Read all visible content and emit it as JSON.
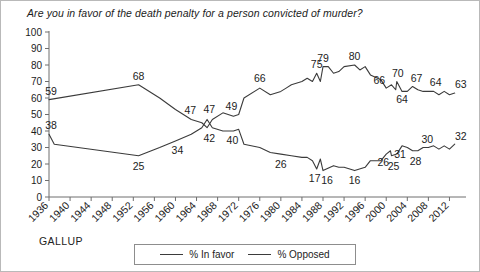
{
  "chart_data": {
    "type": "line",
    "title": "Are you in favor of the death penalty for a person convicted of murder?",
    "source": "GALLUP",
    "xlabel": "",
    "ylabel": "",
    "ylim": [
      0,
      100
    ],
    "ytick_step": 10,
    "grid": false,
    "legend_position": "bottom",
    "yticks": [
      "100",
      "90",
      "80",
      "70",
      "60",
      "50",
      "40",
      "30",
      "20",
      "10",
      "0"
    ],
    "categories": [
      "1936",
      "1940",
      "1944",
      "1948",
      "1952",
      "1956",
      "1960",
      "1964",
      "1968",
      "1972",
      "1976",
      "1980",
      "1984",
      "1988",
      "1992",
      "1996",
      "2000",
      "2004",
      "2008",
      "2012"
    ],
    "xlim": [
      1936,
      2014
    ],
    "series": [
      {
        "name": "% In favor",
        "points": [
          {
            "x": 1936,
            "y": 59,
            "label": "59"
          },
          {
            "x": 1953,
            "y": 68,
            "label": "68"
          },
          {
            "x": 1957,
            "y": 60
          },
          {
            "x": 1960,
            "y": 53
          },
          {
            "x": 1963,
            "y": 47,
            "label": "47"
          },
          {
            "x": 1965,
            "y": 45
          },
          {
            "x": 1966,
            "y": 42
          },
          {
            "x": 1967,
            "y": 47,
            "label": "47"
          },
          {
            "x": 1969,
            "y": 51
          },
          {
            "x": 1971,
            "y": 49,
            "label": "49"
          },
          {
            "x": 1972,
            "y": 50
          },
          {
            "x": 1973,
            "y": 60
          },
          {
            "x": 1976,
            "y": 66,
            "label": "66"
          },
          {
            "x": 1978,
            "y": 62
          },
          {
            "x": 1980,
            "y": 64
          },
          {
            "x": 1981,
            "y": 66
          },
          {
            "x": 1982,
            "y": 68
          },
          {
            "x": 1984,
            "y": 70
          },
          {
            "x": 1985,
            "y": 72
          },
          {
            "x": 1986,
            "y": 70
          },
          {
            "x": 1986.8,
            "y": 75,
            "label": "75"
          },
          {
            "x": 1987.5,
            "y": 70
          },
          {
            "x": 1988,
            "y": 79,
            "label": "79"
          },
          {
            "x": 1989,
            "y": 79
          },
          {
            "x": 1990,
            "y": 75
          },
          {
            "x": 1991,
            "y": 76
          },
          {
            "x": 1992,
            "y": 79
          },
          {
            "x": 1994,
            "y": 80,
            "label": "80"
          },
          {
            "x": 1995,
            "y": 77
          },
          {
            "x": 1996,
            "y": 79
          },
          {
            "x": 1997,
            "y": 74
          },
          {
            "x": 1999,
            "y": 71
          },
          {
            "x": 2000,
            "y": 66,
            "label": "66"
          },
          {
            "x": 2001,
            "y": 68
          },
          {
            "x": 2001.8,
            "y": 65
          },
          {
            "x": 2002,
            "y": 70,
            "label": "70"
          },
          {
            "x": 2003,
            "y": 64,
            "label": "64"
          },
          {
            "x": 2004,
            "y": 64
          },
          {
            "x": 2005,
            "y": 67,
            "label": "67"
          },
          {
            "x": 2006,
            "y": 65
          },
          {
            "x": 2007,
            "y": 64
          },
          {
            "x": 2008,
            "y": 64
          },
          {
            "x": 2009,
            "y": 64,
            "label": "64"
          },
          {
            "x": 2010,
            "y": 62
          },
          {
            "x": 2011,
            "y": 64
          },
          {
            "x": 2012,
            "y": 62
          },
          {
            "x": 2013,
            "y": 63,
            "label": "63"
          }
        ]
      },
      {
        "name": "% Opposed",
        "points": [
          {
            "x": 1936,
            "y": 38,
            "label": "38"
          },
          {
            "x": 1937,
            "y": 32
          },
          {
            "x": 1953,
            "y": 25,
            "label": "25"
          },
          {
            "x": 1957,
            "y": 30
          },
          {
            "x": 1960,
            "y": 34,
            "label": "34"
          },
          {
            "x": 1963,
            "y": 38
          },
          {
            "x": 1965,
            "y": 42
          },
          {
            "x": 1966,
            "y": 47
          },
          {
            "x": 1967,
            "y": 42,
            "label": "42"
          },
          {
            "x": 1969,
            "y": 40
          },
          {
            "x": 1971,
            "y": 40,
            "label": "40"
          },
          {
            "x": 1972,
            "y": 41
          },
          {
            "x": 1973,
            "y": 32
          },
          {
            "x": 1976,
            "y": 30
          },
          {
            "x": 1978,
            "y": 27
          },
          {
            "x": 1980,
            "y": 26,
            "label": "26"
          },
          {
            "x": 1982,
            "y": 25
          },
          {
            "x": 1984,
            "y": 24
          },
          {
            "x": 1985,
            "y": 24
          },
          {
            "x": 1986,
            "y": 22
          },
          {
            "x": 1986.8,
            "y": 17,
            "label": "17"
          },
          {
            "x": 1987.5,
            "y": 23
          },
          {
            "x": 1988,
            "y": 16,
            "label": "16"
          },
          {
            "x": 1990,
            "y": 19
          },
          {
            "x": 1991,
            "y": 18
          },
          {
            "x": 1992,
            "y": 18
          },
          {
            "x": 1994,
            "y": 16,
            "label": "16"
          },
          {
            "x": 1996,
            "y": 18
          },
          {
            "x": 1997,
            "y": 22
          },
          {
            "x": 1999,
            "y": 22
          },
          {
            "x": 2000,
            "y": 26,
            "label": "26"
          },
          {
            "x": 2000.8,
            "y": 28
          },
          {
            "x": 2001,
            "y": 25,
            "label": "25"
          },
          {
            "x": 2002,
            "y": 26
          },
          {
            "x": 2003,
            "y": 31,
            "label": "31"
          },
          {
            "x": 2004,
            "y": 30
          },
          {
            "x": 2005,
            "y": 28,
            "label": "28"
          },
          {
            "x": 2006,
            "y": 28
          },
          {
            "x": 2007,
            "y": 30
          },
          {
            "x": 2008,
            "y": 30,
            "label": "30"
          },
          {
            "x": 2009,
            "y": 31
          },
          {
            "x": 2010,
            "y": 29
          },
          {
            "x": 2011,
            "y": 31
          },
          {
            "x": 2012,
            "y": 29
          },
          {
            "x": 2013,
            "y": 32,
            "label": "32"
          }
        ]
      }
    ]
  },
  "legend": {
    "entries": [
      {
        "label": "% In favor"
      },
      {
        "label": "% Opposed"
      }
    ]
  },
  "colors": {
    "line": "#3b3b3b",
    "axis": "#6e6e6e",
    "text": "#1c1c1c",
    "frame": "#b9b9b9"
  }
}
